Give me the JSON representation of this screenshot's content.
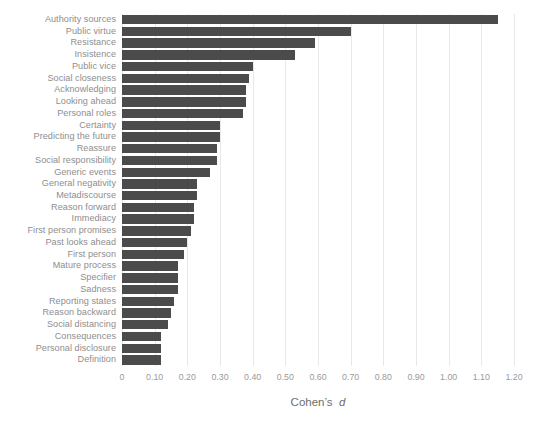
{
  "chart_data": {
    "type": "bar",
    "orientation": "horizontal",
    "title": "",
    "subtitle": "",
    "xlabel": "Cohen's d",
    "ylabel": "",
    "xlim": [
      0,
      1.2
    ],
    "ylim": null,
    "grid": true,
    "grid_axis": "x",
    "legend": false,
    "legend_position": "none",
    "bar_color": "#4b4b4b",
    "gridline_color": "#e8e8e8",
    "label_color": "#8e8e8e",
    "tick_color": "#9a9a9a",
    "background_color": "#ffffff",
    "xticks": [
      0,
      0.1,
      0.2,
      0.3,
      0.4,
      0.5,
      0.6,
      0.7,
      0.8,
      0.9,
      1.0,
      1.1,
      1.2
    ],
    "xticklabels": [
      "0",
      "0.10",
      "0.20",
      "0.30",
      "0.40",
      "0.50",
      "0.60",
      "0.70",
      "0.80",
      "0.90",
      "1.00",
      "1.10",
      "1.20"
    ],
    "categories": [
      "Authority sources",
      "Public virtue",
      "Resistance",
      "Insistence",
      "Public vice",
      "Social closeness",
      "Acknowledging",
      "Looking ahead",
      "Personal roles",
      "Certainty",
      "Predicting the future",
      "Reassure",
      "Social responsibility",
      "Generic events",
      "General negativity",
      "Metadiscourse",
      "Reason forward",
      "Immediacy",
      "First person promises",
      "Past looks ahead",
      "First person",
      "Mature process",
      "Specifier",
      "Sadness",
      "Reporting states",
      "Reason backward",
      "Social distancing",
      "Consequences",
      "Personal disclosure",
      "Definition"
    ],
    "values": [
      1.15,
      0.7,
      0.59,
      0.53,
      0.4,
      0.39,
      0.38,
      0.38,
      0.37,
      0.3,
      0.3,
      0.29,
      0.29,
      0.27,
      0.23,
      0.23,
      0.22,
      0.22,
      0.21,
      0.2,
      0.19,
      0.17,
      0.17,
      0.17,
      0.16,
      0.15,
      0.14,
      0.12,
      0.12,
      0.12
    ]
  }
}
